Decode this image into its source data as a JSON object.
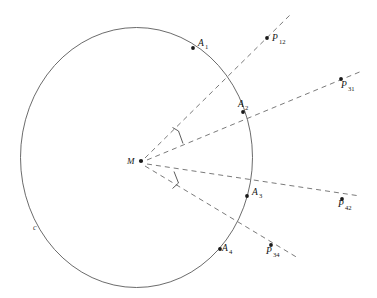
{
  "figure": {
    "background_color": "#ffffff",
    "stroke_color": "#5a5a5a",
    "dash_color": "#6b6b6b",
    "point_color": "#1a1a1a",
    "width": 377,
    "height": 298
  },
  "circle": {
    "label": "c",
    "label_x": 33,
    "label_y": 230,
    "center_x": 136.5,
    "center_y": 157.5,
    "radius_x": 116,
    "radius_y": 130
  },
  "center_point": {
    "label": "M",
    "x": 141,
    "y": 161,
    "label_x": 127,
    "label_y": 164
  },
  "circle_points": [
    {
      "label": "A",
      "sub": "1",
      "x": 193,
      "y": 48,
      "label_x": 198,
      "label_y": 46,
      "sub_x": 205,
      "sub_y": 49
    },
    {
      "label": "A",
      "sub": "2",
      "x": 243,
      "y": 112,
      "label_x": 238,
      "label_y": 107,
      "sub_x": 245,
      "sub_y": 110
    },
    {
      "label": "A",
      "sub": "3",
      "x": 247,
      "y": 196,
      "label_x": 252,
      "label_y": 195,
      "sub_x": 259,
      "sub_y": 198
    },
    {
      "label": "A",
      "sub": "4",
      "x": 220,
      "y": 249,
      "label_x": 222,
      "label_y": 251,
      "sub_x": 229,
      "sub_y": 254
    }
  ],
  "external_points": [
    {
      "label": "P",
      "sub": "12",
      "x": 267,
      "y": 38,
      "label_x": 272,
      "label_y": 41,
      "sub_x": 279,
      "sub_y": 44
    },
    {
      "label": "P",
      "sub": "31",
      "x": 341,
      "y": 79,
      "label_x": 341,
      "label_y": 88,
      "sub_x": 348,
      "sub_y": 91
    },
    {
      "label": "P",
      "sub": "42",
      "x": 342,
      "y": 199,
      "label_x": 338,
      "label_y": 207,
      "sub_x": 345,
      "sub_y": 210
    },
    {
      "label": "P",
      "sub": "34",
      "x": 271,
      "y": 245,
      "label_x": 266,
      "label_y": 254,
      "sub_x": 273,
      "sub_y": 257
    }
  ],
  "rays": [
    {
      "name": "ray-M-A1-P12",
      "x1": 145,
      "y1": 158,
      "x2": 290,
      "y2": 15
    },
    {
      "name": "ray-M-A2-P31",
      "x1": 147,
      "y1": 160,
      "x2": 362,
      "y2": 71
    },
    {
      "name": "ray-M-A3-P42",
      "x1": 147,
      "y1": 164,
      "x2": 360,
      "y2": 196
    },
    {
      "name": "ray-M-A4-P34",
      "x1": 145,
      "y1": 166,
      "x2": 298,
      "y2": 258
    }
  ],
  "angle_marks": [
    {
      "name": "angle-arc-upper",
      "path": "M 172.5 127.5 L 178.5 131.0 L 183.0 143.5"
    },
    {
      "name": "angle-arc-lower",
      "path": "M 174.0 171.5 L 178.5 183.0 L 172.5 188.5"
    }
  ]
}
